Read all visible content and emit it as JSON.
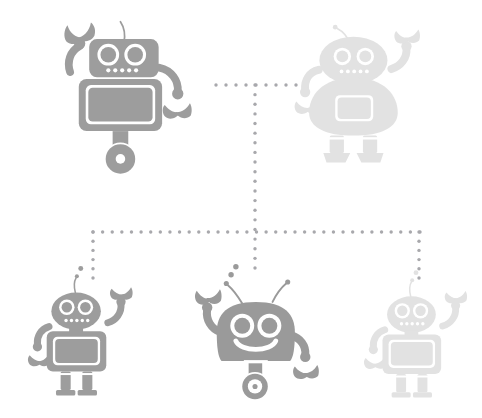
{
  "canvas": {
    "width": 482,
    "height": 418,
    "background": "#ffffff",
    "title": "Robot hierarchy diagram"
  },
  "palette": {
    "connector_dot": "#a8a8ac",
    "robot_strong_body": "#9d9d9d",
    "robot_strong_limb": "#acacac",
    "robot_strong_screen": "#c9c9c9",
    "robot_strong_outline": "#ffffff",
    "robot_faded_body": "#e2e2e2",
    "robot_faded_screen": "#ededed",
    "robot_faded_outline": "#ffffff",
    "robot_medium_body": "#9a9a9a"
  },
  "connectors": {
    "dot_radius": 1.7,
    "dot_spacing": 9.6,
    "color": "#a8a8ac",
    "segments": [
      {
        "name": "top-horizontal-branch",
        "orientation": "horizontal",
        "x1": 216,
        "x2": 296,
        "y": 85
      },
      {
        "name": "center-vertical-trunk",
        "orientation": "vertical",
        "x": 255,
        "y1": 85,
        "y2": 268
      },
      {
        "name": "main-horizontal-bus",
        "orientation": "horizontal",
        "x1": 93,
        "x2": 420,
        "y": 232
      },
      {
        "name": "left-child-drop",
        "orientation": "vertical",
        "x": 93,
        "y1": 232,
        "y2": 278
      },
      {
        "name": "right-child-drop",
        "orientation": "vertical",
        "x": 419,
        "y1": 232,
        "y2": 278
      }
    ]
  },
  "nodes": [
    {
      "id": "robot-top-left",
      "label": "Top left robot",
      "style": "boxy-wheeled",
      "emphasis": "strong",
      "head_shape": "rounded-rectangle",
      "base": "single-wheel",
      "antenna_count": 1,
      "eye_count": 2,
      "mouth_dots": 5,
      "arms": [
        "raised-left-claw",
        "lowered-right-claw"
      ],
      "x": 56,
      "y": 22,
      "width": 152,
      "height": 158
    },
    {
      "id": "robot-top-right",
      "label": "Top right robot",
      "style": "round-legged",
      "emphasis": "faded",
      "head_shape": "rounded-dome",
      "base": "two-legs",
      "antenna_count": 1,
      "eye_count": 2,
      "mouth_dots": 5,
      "arms": [
        "lowered-left-claw",
        "raised-right-claw"
      ],
      "x": 302,
      "y": 26,
      "width": 150,
      "height": 152
    },
    {
      "id": "robot-bottom-left",
      "label": "Bottom left robot",
      "style": "boxy-legged",
      "emphasis": "strong",
      "head_shape": "oval",
      "base": "two-legs",
      "antenna_count": 1,
      "eye_count": 2,
      "mouth_dots": 5,
      "arms": [
        "lowered-left-claw",
        "raised-right-claw"
      ],
      "x": 36,
      "y": 268,
      "width": 120,
      "height": 130
    },
    {
      "id": "robot-bottom-center",
      "label": "Bottom center robot",
      "style": "smiling-wheeled",
      "emphasis": "medium",
      "head_shape": "large-rounded-square",
      "base": "single-wheel",
      "antenna_count": 2,
      "eye_count": 2,
      "mouth_dots": 0,
      "mouth": "smile",
      "arms": [
        "raised-left-claw",
        "lowered-right-claw"
      ],
      "x": 200,
      "y": 266,
      "width": 126,
      "height": 140
    },
    {
      "id": "robot-bottom-right",
      "label": "Bottom right robot",
      "style": "boxy-legged",
      "emphasis": "faded",
      "head_shape": "rounded-rectangle",
      "base": "two-legs",
      "antenna_count": 1,
      "eye_count": 2,
      "mouth_dots": 5,
      "arms": [
        "lowered-left-claw",
        "raised-right-claw"
      ],
      "x": 372,
      "y": 272,
      "width": 110,
      "height": 128
    }
  ]
}
